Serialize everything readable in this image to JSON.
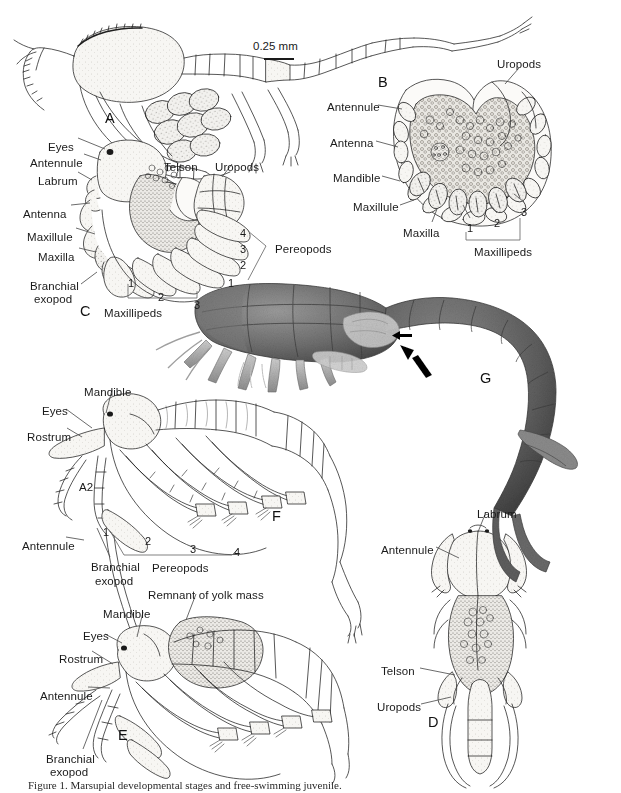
{
  "figure": {
    "width": 621,
    "height": 793,
    "background": "#ffffff",
    "ink": "#1a1a1a",
    "leader_color": "#4a4a4a",
    "caption": "Figure 1. Marsupial developmental stages and free-swimming juvenile.",
    "scale_bar": {
      "text": "0.25 mm"
    }
  },
  "panels": [
    {
      "id": "A",
      "letter": "A",
      "x": 105,
      "y": 110,
      "description": "lateral view of embryo with large yolk sac and long antenna"
    },
    {
      "id": "B",
      "letter": "B",
      "x": 378,
      "y": 74,
      "description": "ventral view of folded embryo"
    },
    {
      "id": "C",
      "letter": "C",
      "x": 80,
      "y": 303,
      "description": "lateral view of later embryo with appendages"
    },
    {
      "id": "D",
      "letter": "D",
      "x": 428,
      "y": 714,
      "description": "dorsal view of juvenile head and pleon"
    },
    {
      "id": "E",
      "letter": "E",
      "x": 118,
      "y": 727,
      "description": "lateral view of juvenile with remnant of yolk mass"
    },
    {
      "id": "F",
      "letter": "F",
      "x": 272,
      "y": 508,
      "description": "lateral view of fully developed manca"
    },
    {
      "id": "G",
      "letter": "G",
      "x": 480,
      "y": 370,
      "description": "scanning electron micrograph, lateral view, arrow marks marsupium margin"
    }
  ],
  "labels": {
    "A": [],
    "B": [
      {
        "text": "Uropods",
        "x": 497,
        "y": 58,
        "anchor": "start"
      },
      {
        "text": "Antennule",
        "x": 327,
        "y": 101,
        "anchor": "start"
      },
      {
        "text": "Antenna",
        "x": 330,
        "y": 137,
        "anchor": "start"
      },
      {
        "text": "Mandible",
        "x": 333,
        "y": 172,
        "anchor": "start"
      },
      {
        "text": "Maxillule",
        "x": 353,
        "y": 201,
        "anchor": "start"
      },
      {
        "text": "Maxilla",
        "x": 403,
        "y": 227,
        "anchor": "start"
      },
      {
        "text": "1",
        "x": 467,
        "y": 222,
        "anchor": "start",
        "num": true
      },
      {
        "text": "2",
        "x": 494,
        "y": 217,
        "anchor": "start",
        "num": true
      },
      {
        "text": "3",
        "x": 521,
        "y": 206,
        "anchor": "start",
        "num": true
      },
      {
        "text": "Maxillipeds",
        "x": 474,
        "y": 246,
        "anchor": "start"
      }
    ],
    "C": [
      {
        "text": "Eyes",
        "x": 48,
        "y": 141,
        "anchor": "start"
      },
      {
        "text": "Antennule",
        "x": 30,
        "y": 157,
        "anchor": "start"
      },
      {
        "text": "Labrum",
        "x": 38,
        "y": 175,
        "anchor": "start"
      },
      {
        "text": "Antenna",
        "x": 23,
        "y": 208,
        "anchor": "start"
      },
      {
        "text": "Maxillule",
        "x": 27,
        "y": 231,
        "anchor": "start"
      },
      {
        "text": "Maxilla",
        "x": 38,
        "y": 251,
        "anchor": "start"
      },
      {
        "text": "Branchial",
        "x": 30,
        "y": 280,
        "anchor": "start"
      },
      {
        "text": "exopod",
        "x": 34,
        "y": 293,
        "anchor": "start"
      },
      {
        "text": "Telson",
        "x": 164,
        "y": 161,
        "anchor": "start"
      },
      {
        "text": "Uropods",
        "x": 215,
        "y": 161,
        "anchor": "start"
      },
      {
        "text": "1",
        "x": 128,
        "y": 277,
        "anchor": "start",
        "num": true
      },
      {
        "text": "2",
        "x": 158,
        "y": 291,
        "anchor": "start",
        "num": true
      },
      {
        "text": "3",
        "x": 194,
        "y": 299,
        "anchor": "start",
        "num": true
      },
      {
        "text": "Maxillipeds",
        "x": 104,
        "y": 307,
        "anchor": "start"
      },
      {
        "text": "4",
        "x": 240,
        "y": 227,
        "anchor": "start",
        "num": true
      },
      {
        "text": "3",
        "x": 240,
        "y": 243,
        "anchor": "start",
        "num": true
      },
      {
        "text": "2",
        "x": 240,
        "y": 259,
        "anchor": "start",
        "num": true
      },
      {
        "text": "1",
        "x": 228,
        "y": 277,
        "anchor": "start",
        "num": true
      },
      {
        "text": "Pereopods",
        "x": 275,
        "y": 243,
        "anchor": "start"
      }
    ],
    "F": [
      {
        "text": "Mandible",
        "x": 84,
        "y": 386,
        "anchor": "start"
      },
      {
        "text": "Eyes",
        "x": 42,
        "y": 405,
        "anchor": "start"
      },
      {
        "text": "Rostrum",
        "x": 27,
        "y": 431,
        "anchor": "start"
      },
      {
        "text": "A2",
        "x": 79,
        "y": 481,
        "anchor": "start"
      },
      {
        "text": "Antennule",
        "x": 22,
        "y": 540,
        "anchor": "start"
      },
      {
        "text": "Branchial",
        "x": 91,
        "y": 561,
        "anchor": "start"
      },
      {
        "text": "exopod",
        "x": 95,
        "y": 575,
        "anchor": "start"
      },
      {
        "text": "1",
        "x": 103,
        "y": 526,
        "anchor": "start",
        "num": true
      },
      {
        "text": "2",
        "x": 145,
        "y": 535,
        "anchor": "start",
        "num": true
      },
      {
        "text": "3",
        "x": 190,
        "y": 543,
        "anchor": "start",
        "num": true
      },
      {
        "text": "4",
        "x": 234,
        "y": 546,
        "anchor": "start",
        "num": true
      },
      {
        "text": "Pereopods",
        "x": 152,
        "y": 562,
        "anchor": "start"
      }
    ],
    "E": [
      {
        "text": "Remnant of yolk mass",
        "x": 148,
        "y": 589,
        "anchor": "start"
      },
      {
        "text": "Mandible",
        "x": 103,
        "y": 608,
        "anchor": "start"
      },
      {
        "text": "Eyes",
        "x": 83,
        "y": 630,
        "anchor": "start"
      },
      {
        "text": "Rostrum",
        "x": 59,
        "y": 653,
        "anchor": "start"
      },
      {
        "text": "Antennule",
        "x": 40,
        "y": 690,
        "anchor": "start"
      },
      {
        "text": "Branchial",
        "x": 46,
        "y": 753,
        "anchor": "start"
      },
      {
        "text": "exopod",
        "x": 50,
        "y": 766,
        "anchor": "start"
      }
    ],
    "D": [
      {
        "text": "Labrum",
        "x": 477,
        "y": 508,
        "anchor": "start"
      },
      {
        "text": "Antennule",
        "x": 381,
        "y": 544,
        "anchor": "start"
      },
      {
        "text": "Telson",
        "x": 381,
        "y": 665,
        "anchor": "start"
      },
      {
        "text": "Uropods",
        "x": 377,
        "y": 701,
        "anchor": "start"
      }
    ],
    "G": []
  },
  "leaders": {
    "B": [
      {
        "x1": 519,
        "y1": 68,
        "x2": 505,
        "y2": 84
      },
      {
        "x1": 378,
        "y1": 105,
        "x2": 402,
        "y2": 109
      },
      {
        "x1": 376,
        "y1": 141,
        "x2": 398,
        "y2": 147
      },
      {
        "x1": 382,
        "y1": 176,
        "x2": 400,
        "y2": 181
      },
      {
        "x1": 400,
        "y1": 205,
        "x2": 414,
        "y2": 200
      },
      {
        "x1": 432,
        "y1": 222,
        "x2": 437,
        "y2": 209
      },
      {
        "x1": 470,
        "y1": 218,
        "x2": 463,
        "y2": 205
      },
      {
        "x1": 497,
        "y1": 213,
        "x2": 489,
        "y2": 203
      },
      {
        "x1": 524,
        "y1": 202,
        "x2": 514,
        "y2": 194
      }
    ],
    "C": [
      {
        "x1": 78,
        "y1": 138,
        "x2": 105,
        "y2": 149
      },
      {
        "x1": 84,
        "y1": 154,
        "x2": 101,
        "y2": 160
      },
      {
        "x1": 78,
        "y1": 172,
        "x2": 92,
        "y2": 180
      },
      {
        "x1": 71,
        "y1": 205,
        "x2": 90,
        "y2": 203
      },
      {
        "x1": 76,
        "y1": 228,
        "x2": 95,
        "y2": 234
      },
      {
        "x1": 79,
        "y1": 248,
        "x2": 96,
        "y2": 252
      },
      {
        "x1": 81,
        "y1": 284,
        "x2": 97,
        "y2": 272
      },
      {
        "x1": 181,
        "y1": 164,
        "x2": 176,
        "y2": 176
      },
      {
        "x1": 232,
        "y1": 164,
        "x2": 222,
        "y2": 177
      }
    ],
    "F": [
      {
        "x1": 112,
        "y1": 390,
        "x2": 106,
        "y2": 413
      },
      {
        "x1": 66,
        "y1": 409,
        "x2": 92,
        "y2": 428
      },
      {
        "x1": 67,
        "y1": 428,
        "x2": 82,
        "y2": 437
      },
      {
        "x1": 66,
        "y1": 537,
        "x2": 84,
        "y2": 540
      },
      {
        "x1": 110,
        "y1": 557,
        "x2": 97,
        "y2": 528
      }
    ],
    "E": [
      {
        "x1": 196,
        "y1": 594,
        "x2": 186,
        "y2": 620
      },
      {
        "x1": 143,
        "y1": 612,
        "x2": 137,
        "y2": 637
      },
      {
        "x1": 105,
        "y1": 634,
        "x2": 122,
        "y2": 643
      },
      {
        "x1": 92,
        "y1": 651,
        "x2": 113,
        "y2": 664
      },
      {
        "x1": 88,
        "y1": 687,
        "x2": 110,
        "y2": 688
      },
      {
        "x1": 83,
        "y1": 749,
        "x2": 102,
        "y2": 700
      }
    ],
    "D": [
      {
        "x1": 486,
        "y1": 512,
        "x2": 478,
        "y2": 532
      },
      {
        "x1": 436,
        "y1": 547,
        "x2": 459,
        "y2": 558
      },
      {
        "x1": 420,
        "y1": 668,
        "x2": 455,
        "y2": 675
      },
      {
        "x1": 421,
        "y1": 704,
        "x2": 451,
        "y2": 697
      }
    ]
  },
  "brackets": [
    {
      "panel": "B",
      "name": "maxillipeds-bracket",
      "points": "466,232 466,240 520,240 520,218"
    },
    {
      "panel": "C",
      "name": "maxillipeds-bracket",
      "points": "128,284 128,298 197,298 197,291"
    },
    {
      "panel": "C",
      "name": "pereopods-bracket",
      "points": "248,231 266,246 248,280"
    },
    {
      "panel": "F",
      "name": "pereopods-bracket",
      "points": "110,531 124,555 232,555 238,549"
    }
  ],
  "scale_bar": {
    "text": "0.25 mm",
    "text_x": 253,
    "text_y": 40,
    "line_x": 264,
    "line_y": 58,
    "line_w": 30
  },
  "sem": {
    "arrow_large": {
      "x": 400,
      "y": 352,
      "angle": 55
    },
    "arrow_small": {
      "x": 395,
      "y": 337,
      "angle": 0
    },
    "tone": "#6e6e6e"
  }
}
